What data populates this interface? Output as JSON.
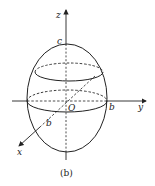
{
  "figure": {
    "caption": "(b)",
    "axes": {
      "x_label": "x",
      "y_label": "y",
      "z_label": "z",
      "origin_label": "O"
    },
    "annotations": {
      "top_intercept": "c",
      "y_intercept": "b",
      "x_intercept": "b"
    },
    "colors": {
      "stroke": "#222222",
      "background": "#ffffff"
    }
  }
}
